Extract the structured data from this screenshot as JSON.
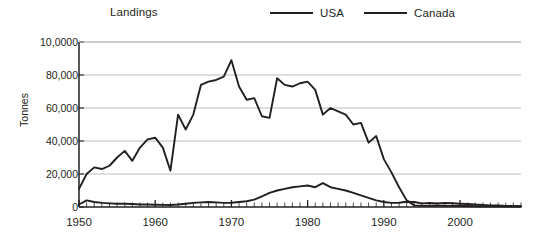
{
  "legend": {
    "title": "Landings",
    "entries": [
      {
        "label": "USA",
        "color": "#231f20"
      },
      {
        "label": "Canada",
        "color": "#231f20"
      }
    ]
  },
  "axes": {
    "ylabel": "Tonnes",
    "ytick_labels": [
      "10,0000",
      "80,000",
      "60,000",
      "40,000",
      "20,000",
      "0"
    ],
    "xtick_labels": [
      "1950",
      "1960",
      "1970",
      "1980",
      "1990",
      "2000"
    ]
  },
  "chart_data": {
    "type": "line",
    "title": "Landings",
    "xlabel": "",
    "ylabel": "Tonnes",
    "xlim": [
      1950,
      2008
    ],
    "ylim": [
      0,
      100000
    ],
    "xticks": [
      1950,
      1960,
      1970,
      1980,
      1990,
      2000
    ],
    "yticks": [
      0,
      20000,
      40000,
      60000,
      80000,
      100000
    ],
    "ytick_labels": [
      "0",
      "20,000",
      "40,000",
      "60,000",
      "80,000",
      "10,0000"
    ],
    "grid": "horizontal",
    "legend_position": "top",
    "minor_xticks": "every year",
    "x": [
      1950,
      1951,
      1952,
      1953,
      1954,
      1955,
      1956,
      1957,
      1958,
      1959,
      1960,
      1961,
      1962,
      1963,
      1964,
      1965,
      1966,
      1967,
      1968,
      1969,
      1970,
      1971,
      1972,
      1973,
      1974,
      1975,
      1976,
      1977,
      1978,
      1979,
      1980,
      1981,
      1982,
      1983,
      1984,
      1985,
      1986,
      1987,
      1988,
      1989,
      1990,
      1991,
      1992,
      1993,
      1994,
      1995,
      1996,
      1997,
      1998,
      1999,
      2000,
      2001,
      2002,
      2003,
      2004,
      2005,
      2006,
      2007,
      2008
    ],
    "series": [
      {
        "name": "Canada",
        "color": "#231f20",
        "values": [
          11000,
          20000,
          24000,
          23000,
          25000,
          30000,
          34000,
          28000,
          36000,
          41000,
          42000,
          36000,
          22000,
          56000,
          47000,
          56000,
          74000,
          76000,
          77000,
          79000,
          89000,
          73000,
          65000,
          66000,
          55000,
          54000,
          78000,
          74000,
          73000,
          75000,
          76000,
          71000,
          56000,
          60000,
          58000,
          56000,
          50000,
          51000,
          39000,
          43000,
          29000,
          21000,
          12000,
          4000,
          1000,
          800,
          700,
          900,
          800,
          700,
          600,
          600,
          500,
          500,
          400,
          400,
          300,
          300,
          300
        ]
      },
      {
        "name": "USA",
        "color": "#231f20",
        "values": [
          1500,
          4000,
          3000,
          2500,
          2200,
          2000,
          2000,
          1800,
          1500,
          1500,
          1400,
          1300,
          1200,
          1500,
          2000,
          2500,
          2800,
          3000,
          2800,
          2500,
          2600,
          3000,
          3500,
          4500,
          6500,
          8500,
          10000,
          11000,
          12000,
          12500,
          13000,
          12000,
          14500,
          12000,
          11000,
          10000,
          8500,
          7000,
          5500,
          4000,
          3000,
          2500,
          2600,
          3200,
          3000,
          2200,
          2400,
          2200,
          2500,
          2300,
          2000,
          1800,
          1500,
          1300,
          1000,
          900,
          700,
          600,
          500
        ]
      }
    ]
  }
}
